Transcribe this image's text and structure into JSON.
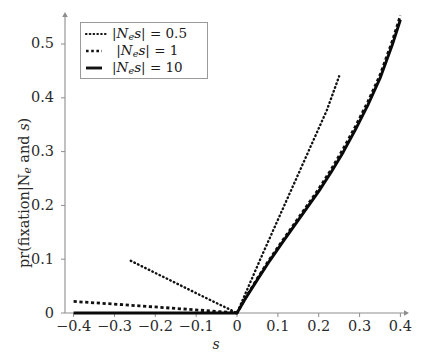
{
  "chart_data": {
    "type": "line",
    "title": "",
    "xlabel": "s",
    "ylabel": "pr(fixation|Ne and s)",
    "xlim": [
      -0.44,
      0.43
    ],
    "ylim": [
      0,
      0.58
    ],
    "grid": false,
    "legend_position": "top-left",
    "xticks": [
      -0.4,
      -0.3,
      -0.2,
      -0.1,
      0,
      0.1,
      0.2,
      0.3,
      0.4
    ],
    "xticklabels": [
      "−0.4",
      "−0.3",
      "−0.2",
      "−0.1",
      "0",
      "0.1",
      "0.2",
      "0.3",
      "0.4"
    ],
    "yticks": [
      0,
      0.1,
      0.2,
      0.3,
      0.4,
      0.5
    ],
    "yticklabels": [
      "0",
      "0.1",
      "0.2",
      "0.3",
      "0.4",
      "0.5"
    ],
    "series": [
      {
        "name": "|Ne s| = 0.5",
        "style": "dotted",
        "color": "#111111",
        "x": [
          -0.26,
          -0.24,
          -0.22,
          -0.2,
          -0.18,
          -0.16,
          -0.14,
          -0.12,
          -0.1,
          -0.08,
          -0.06,
          -0.04,
          -0.02,
          0.0,
          0.02,
          0.04,
          0.06,
          0.08,
          0.1,
          0.12,
          0.14,
          0.16,
          0.18,
          0.2,
          0.22,
          0.25
        ],
        "y": [
          0.097,
          0.0895,
          0.082,
          0.0745,
          0.067,
          0.0595,
          0.052,
          0.0445,
          0.037,
          0.0295,
          0.022,
          0.0148,
          0.0075,
          0.0,
          0.035,
          0.07,
          0.105,
          0.139,
          0.173,
          0.207,
          0.241,
          0.275,
          0.309,
          0.343,
          0.377,
          0.44
        ]
      },
      {
        "name": "|Ne s| = 1",
        "style": "dashed",
        "color": "#111111",
        "x": [
          -0.4,
          -0.36,
          -0.32,
          -0.28,
          -0.24,
          -0.2,
          -0.16,
          -0.12,
          -0.08,
          -0.04,
          0.0,
          0.02,
          0.05,
          0.08,
          0.11,
          0.14,
          0.17,
          0.2,
          0.23,
          0.26,
          0.29,
          0.32,
          0.35,
          0.38,
          0.4
        ],
        "y": [
          0.0215,
          0.0195,
          0.0175,
          0.0155,
          0.0133,
          0.0112,
          0.009,
          0.0069,
          0.0046,
          0.0023,
          0.0,
          0.027,
          0.0645,
          0.1,
          0.133,
          0.1655,
          0.198,
          0.2305,
          0.266,
          0.305,
          0.347,
          0.392,
          0.442,
          0.505,
          0.553
        ]
      },
      {
        "name": "|Ne s| = 10",
        "style": "solid",
        "color": "#0a0a0a",
        "x": [
          -0.4,
          -0.35,
          -0.3,
          -0.25,
          -0.2,
          -0.15,
          -0.1,
          -0.05,
          0.0,
          0.02,
          0.05,
          0.08,
          0.11,
          0.14,
          0.17,
          0.2,
          0.23,
          0.26,
          0.29,
          0.32,
          0.35,
          0.38,
          0.4
        ],
        "y": [
          0.0,
          0.0,
          0.0,
          0.0,
          0.0,
          0.0,
          0.0,
          0.0,
          0.0,
          0.026,
          0.062,
          0.097,
          0.13,
          0.162,
          0.194,
          0.226,
          0.261,
          0.299,
          0.341,
          0.386,
          0.436,
          0.498,
          0.545
        ]
      }
    ]
  },
  "legend": {
    "entries": [
      {
        "label_prefix": "|N",
        "label_sub": "e",
        "label_mid": "s|",
        "label_eq": "= 0.5"
      },
      {
        "label_prefix": "|N",
        "label_sub": "e",
        "label_mid": "s|",
        "label_eq": "= 1"
      },
      {
        "label_prefix": "|N",
        "label_sub": "e",
        "label_mid": "s|",
        "label_eq": "= 10"
      }
    ]
  },
  "axes": {
    "x_title": "s",
    "y_title_pre": "pr(fixation|N",
    "y_title_sub": "e",
    "y_title_post": " and ",
    "y_title_s": "s",
    "y_title_close": ")"
  }
}
